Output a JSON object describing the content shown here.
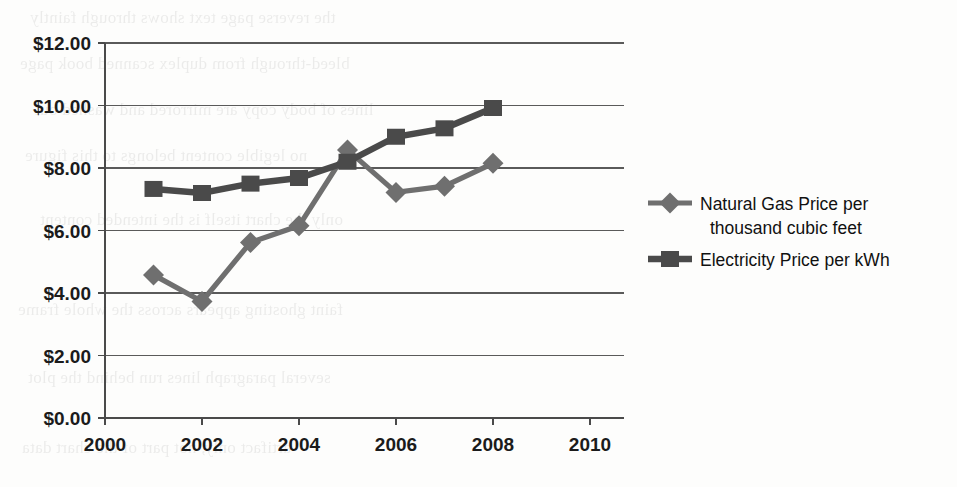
{
  "page": {
    "width": 957,
    "height": 487,
    "background": "#fdfdfc",
    "scan_artifact_text": [
      "the reverse page text shows through faintly",
      "bleed-through from duplex scanned book page",
      "lines of body copy are mirrored and washed out",
      "no legible content belongs to this figure",
      "only the chart itself is the intended content",
      "faint ghosting appears across the whole frame",
      "several paragraph lines run behind the plot",
      "artifact only, not part of the chart data"
    ]
  },
  "chart_data": {
    "type": "line",
    "title": "",
    "subtitle": "",
    "xlabel": "",
    "ylabel": "",
    "x": [
      2001,
      2002,
      2003,
      2004,
      2005,
      2006,
      2007,
      2008
    ],
    "xlim": [
      2000,
      2010
    ],
    "ylim": [
      0,
      12
    ],
    "xticks": [
      2000,
      2002,
      2004,
      2006,
      2008,
      2010
    ],
    "xtick_labels": [
      "2000",
      "2002",
      "2004",
      "2006",
      "2008",
      "2010"
    ],
    "yticks": [
      0,
      2,
      4,
      6,
      8,
      10,
      12
    ],
    "ytick_labels": [
      "$0.00",
      "$2.00",
      "$4.00",
      "$6.00",
      "$8.00",
      "$10.00",
      "$12.00"
    ],
    "grid": "horizontal",
    "legend_position": "right",
    "series": [
      {
        "name": "Natural Gas Price per thousand cubic feet",
        "legend_label_line1": "Natural Gas Price per",
        "legend_label_line2": "thousand cubic feet",
        "marker": "diamond",
        "color": "#6f6f6f",
        "values": [
          4.58,
          3.73,
          5.62,
          6.15,
          8.58,
          7.22,
          7.42,
          8.15
        ]
      },
      {
        "name": "Electricity Price per kWh",
        "legend_label_line1": "Electricity Price per kWh",
        "legend_label_line2": "",
        "marker": "square",
        "color": "#4a4a4a",
        "values": [
          7.33,
          7.2,
          7.5,
          7.68,
          8.2,
          9.0,
          9.27,
          9.92
        ]
      }
    ]
  },
  "colors": {
    "gas": "#6f6f6f",
    "electricity": "#4a4a4a",
    "grid": "#5a5a5a",
    "axis": "#4a4a4a",
    "text": "#1b1b1b"
  },
  "geometry": {
    "plot_left": 105,
    "plot_right": 624,
    "plot_top": 43,
    "plot_bottom": 418,
    "x_per_year": 48.5,
    "y_per_dollar": 31.25,
    "legend_x": 648,
    "legend_y_gas": 203,
    "legend_y_elec": 259
  }
}
